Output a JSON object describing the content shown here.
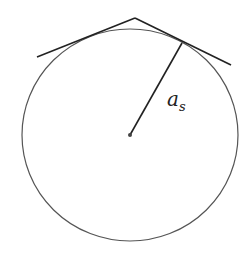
{
  "diagram": {
    "labels": {
      "radius_main": "a",
      "radius_sub": "s"
    },
    "colors": {
      "circle": "#555555",
      "lines": "#222222",
      "background": "#ffffff"
    }
  }
}
